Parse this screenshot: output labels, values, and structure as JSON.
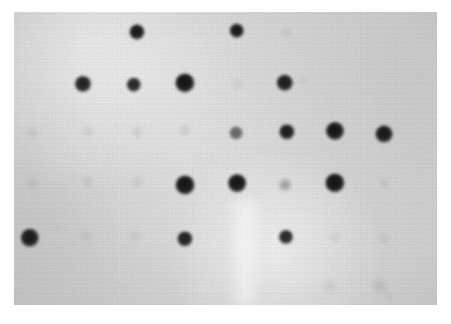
{
  "figure": {
    "kind": "dot-blot-autoradiograph",
    "width": 451,
    "height": 324,
    "page_background": "#ffffff"
  },
  "membrane": {
    "x": 14,
    "y": 12,
    "width": 423,
    "height": 293,
    "background_color": "#d6d6d6",
    "signal_color": "#171717"
  },
  "streak": {
    "x": 228,
    "y": 200,
    "width": 34,
    "height": 108
  },
  "grid": {
    "columns": 8,
    "rows": 6,
    "column_x": [
      33,
      86,
      137,
      186,
      237,
      286,
      335,
      384
    ],
    "row_y": [
      32,
      83,
      131,
      183,
      238,
      287
    ],
    "pitch_x": 50,
    "pitch_y": 50
  },
  "chart_data": {
    "type": "heatmap",
    "title": "",
    "xlabel": "",
    "ylabel": "",
    "note": "Intensity grid read from a dot blot / macroarray autoradiograph. Values are relative signal strength 0 (no signal) to 1 (saturated black spot).",
    "columns": [
      "C1",
      "C2",
      "C3",
      "C4",
      "C5",
      "C6",
      "C7",
      "C8"
    ],
    "rows": [
      "R1",
      "R2",
      "R3",
      "R4",
      "R5",
      "R6"
    ],
    "values": [
      [
        0.0,
        0.0,
        0.95,
        0.0,
        0.95,
        0.07,
        0.0,
        0.0
      ],
      [
        0.0,
        0.9,
        0.88,
        0.97,
        0.06,
        0.92,
        0.0,
        0.0
      ],
      [
        0.07,
        0.08,
        0.08,
        0.09,
        0.55,
        0.92,
        0.96,
        0.94
      ],
      [
        0.06,
        0.07,
        0.07,
        0.96,
        0.96,
        0.3,
        0.97,
        0.06
      ],
      [
        0.93,
        0.06,
        0.06,
        0.9,
        0.0,
        0.88,
        0.06,
        0.05
      ],
      [
        0.0,
        0.0,
        0.0,
        0.0,
        0.0,
        0.0,
        0.08,
        0.1
      ]
    ]
  },
  "spots": [
    {
      "name": "spot-r1c3",
      "row": 1,
      "col": 3,
      "cx": 137,
      "cy": 32,
      "r": 7.5,
      "opacity": 0.95,
      "blur": 1.4
    },
    {
      "name": "spot-r1c5",
      "row": 1,
      "col": 5,
      "cx": 237,
      "cy": 31,
      "r": 7.2,
      "opacity": 0.95,
      "blur": 1.4
    },
    {
      "name": "spot-r1c6",
      "row": 1,
      "col": 6,
      "cx": 286,
      "cy": 33,
      "r": 4.5,
      "opacity": 0.07,
      "blur": 2.6
    },
    {
      "name": "spot-r2c2",
      "row": 2,
      "col": 2,
      "cx": 83,
      "cy": 84,
      "r": 8.0,
      "opacity": 0.9,
      "blur": 1.5
    },
    {
      "name": "spot-r2c3",
      "row": 2,
      "col": 3,
      "cx": 134,
      "cy": 85,
      "r": 7.2,
      "opacity": 0.88,
      "blur": 1.5
    },
    {
      "name": "spot-r2c4",
      "row": 2,
      "col": 4,
      "cx": 185,
      "cy": 83,
      "r": 9.6,
      "opacity": 0.97,
      "blur": 1.7
    },
    {
      "name": "spot-r2c5",
      "row": 2,
      "col": 5,
      "cx": 237,
      "cy": 85,
      "r": 5.0,
      "opacity": 0.06,
      "blur": 2.8
    },
    {
      "name": "spot-r2c6",
      "row": 2,
      "col": 6,
      "cx": 285,
      "cy": 83,
      "r": 8.2,
      "opacity": 0.92,
      "blur": 1.6
    },
    {
      "name": "spot-r3c1",
      "row": 3,
      "col": 1,
      "cx": 33,
      "cy": 133,
      "r": 5.2,
      "opacity": 0.07,
      "blur": 2.8
    },
    {
      "name": "spot-r3c2",
      "row": 3,
      "col": 2,
      "cx": 88,
      "cy": 132,
      "r": 5.0,
      "opacity": 0.08,
      "blur": 2.8
    },
    {
      "name": "spot-r3c3",
      "row": 3,
      "col": 3,
      "cx": 137,
      "cy": 132,
      "r": 5.0,
      "opacity": 0.08,
      "blur": 2.8
    },
    {
      "name": "spot-r3c4",
      "row": 3,
      "col": 4,
      "cx": 185,
      "cy": 131,
      "r": 5.2,
      "opacity": 0.09,
      "blur": 2.8
    },
    {
      "name": "spot-r3c5",
      "row": 3,
      "col": 5,
      "cx": 236,
      "cy": 133,
      "r": 6.4,
      "opacity": 0.55,
      "blur": 1.8
    },
    {
      "name": "spot-r3c6",
      "row": 3,
      "col": 6,
      "cx": 287,
      "cy": 132,
      "r": 7.6,
      "opacity": 0.92,
      "blur": 1.5
    },
    {
      "name": "spot-r3c7",
      "row": 3,
      "col": 7,
      "cx": 335,
      "cy": 131,
      "r": 9.0,
      "opacity": 0.96,
      "blur": 1.7
    },
    {
      "name": "spot-r3c8",
      "row": 3,
      "col": 8,
      "cx": 384,
      "cy": 134,
      "r": 8.4,
      "opacity": 0.94,
      "blur": 1.6
    },
    {
      "name": "spot-r4c1",
      "row": 4,
      "col": 1,
      "cx": 33,
      "cy": 183,
      "r": 5.0,
      "opacity": 0.06,
      "blur": 2.8
    },
    {
      "name": "spot-r4c2",
      "row": 4,
      "col": 2,
      "cx": 88,
      "cy": 182,
      "r": 5.0,
      "opacity": 0.07,
      "blur": 2.8
    },
    {
      "name": "spot-r4c3",
      "row": 4,
      "col": 3,
      "cx": 137,
      "cy": 182,
      "r": 5.0,
      "opacity": 0.07,
      "blur": 2.8
    },
    {
      "name": "spot-r4c4",
      "row": 4,
      "col": 4,
      "cx": 185,
      "cy": 185,
      "r": 9.4,
      "opacity": 0.96,
      "blur": 1.7
    },
    {
      "name": "spot-r4c5",
      "row": 4,
      "col": 5,
      "cx": 237,
      "cy": 183,
      "r": 8.8,
      "opacity": 0.96,
      "blur": 1.6
    },
    {
      "name": "spot-r4c6",
      "row": 4,
      "col": 6,
      "cx": 285,
      "cy": 185,
      "r": 5.4,
      "opacity": 0.3,
      "blur": 2.2
    },
    {
      "name": "spot-r4c7",
      "row": 4,
      "col": 7,
      "cx": 335,
      "cy": 183,
      "r": 9.6,
      "opacity": 0.97,
      "blur": 1.7
    },
    {
      "name": "spot-r4c8",
      "row": 4,
      "col": 8,
      "cx": 384,
      "cy": 184,
      "r": 5.0,
      "opacity": 0.06,
      "blur": 2.8
    },
    {
      "name": "spot-r5c1",
      "row": 5,
      "col": 1,
      "cx": 30,
      "cy": 238,
      "r": 9.2,
      "opacity": 0.93,
      "blur": 1.8
    },
    {
      "name": "spot-r5c2",
      "row": 5,
      "col": 2,
      "cx": 86,
      "cy": 236,
      "r": 4.8,
      "opacity": 0.06,
      "blur": 2.8
    },
    {
      "name": "spot-r5c3",
      "row": 5,
      "col": 3,
      "cx": 135,
      "cy": 236,
      "r": 4.8,
      "opacity": 0.06,
      "blur": 2.8
    },
    {
      "name": "spot-r5c4",
      "row": 5,
      "col": 4,
      "cx": 185,
      "cy": 239,
      "r": 7.6,
      "opacity": 0.9,
      "blur": 1.5
    },
    {
      "name": "spot-r5c6",
      "row": 5,
      "col": 6,
      "cx": 286,
      "cy": 237,
      "r": 7.0,
      "opacity": 0.88,
      "blur": 1.5
    },
    {
      "name": "spot-r5c7",
      "row": 5,
      "col": 7,
      "cx": 335,
      "cy": 237,
      "r": 4.8,
      "opacity": 0.06,
      "blur": 2.8
    },
    {
      "name": "spot-r5c8",
      "row": 5,
      "col": 8,
      "cx": 384,
      "cy": 238,
      "r": 4.8,
      "opacity": 0.05,
      "blur": 2.8
    },
    {
      "name": "spot-r6c7",
      "row": 6,
      "col": 7,
      "cx": 330,
      "cy": 287,
      "r": 5.6,
      "opacity": 0.08,
      "blur": 3.0
    },
    {
      "name": "spot-r6c8",
      "row": 6,
      "col": 8,
      "cx": 380,
      "cy": 286,
      "r": 6.2,
      "opacity": 0.1,
      "blur": 3.0
    }
  ],
  "smudges": [
    {
      "name": "smudge-upper-right",
      "cx": 303,
      "cy": 80,
      "rx": 4,
      "ry": 3,
      "opacity": 0.09,
      "blur": 2.0
    },
    {
      "name": "smudge-mid-left",
      "cx": 57,
      "cy": 226,
      "rx": 3,
      "ry": 2,
      "opacity": 0.07,
      "blur": 2.0
    },
    {
      "name": "smudge-lower-right",
      "cx": 389,
      "cy": 296,
      "rx": 5,
      "ry": 3,
      "opacity": 0.08,
      "blur": 2.5
    },
    {
      "name": "smudge-center",
      "cx": 210,
      "cy": 160,
      "rx": 6,
      "ry": 4,
      "opacity": 0.04,
      "blur": 3.0
    }
  ]
}
